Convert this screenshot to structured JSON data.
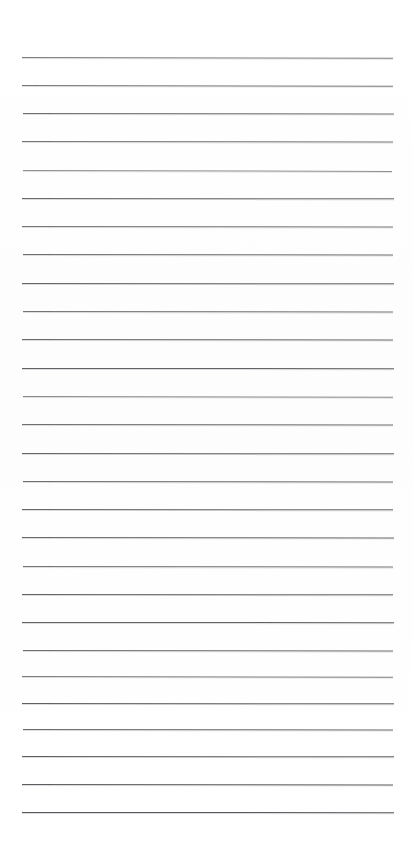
{
  "document": {
    "kind": "ruled-notebook-paper",
    "title": "Blank Ruled Notebook Page",
    "page_width": 413,
    "page_height": 855,
    "background_color": "#ffffff",
    "paper_tone": "#fdfdfd",
    "written_content": "",
    "handwriting_present": false,
    "margin_rule_present": false,
    "page_number_text": "",
    "header_text": "",
    "footer_text": ""
  },
  "ruling": {
    "line_count": 28,
    "line_color": "#4f5155",
    "line_color_light": "#8d9095",
    "line_thickness_px": 1,
    "first_line_y": 57,
    "last_line_y": 812,
    "line_spacing_px": 27.6,
    "left_margin_px": 21,
    "right_margin_px": 19,
    "top_blank_px": 57,
    "bottom_blank_px": 43
  },
  "lines": [
    {
      "index": 1,
      "y": 57,
      "x1": 22,
      "x2": 393,
      "tilt_deg": 0.12,
      "opacity": 0.78,
      "color": "#595b5f",
      "thickness": 1
    },
    {
      "index": 2,
      "y": 85,
      "x1": 22,
      "x2": 393,
      "tilt_deg": 0.1,
      "opacity": 0.8,
      "color": "#54565a",
      "thickness": 1
    },
    {
      "index": 3,
      "y": 113,
      "x1": 23,
      "x2": 394,
      "tilt_deg": 0.06,
      "opacity": 0.82,
      "color": "#4f5155",
      "thickness": 1
    },
    {
      "index": 4,
      "y": 141,
      "x1": 22,
      "x2": 393,
      "tilt_deg": 0.09,
      "opacity": 0.8,
      "color": "#53555a",
      "thickness": 1
    },
    {
      "index": 5,
      "y": 170,
      "x1": 23,
      "x2": 392,
      "tilt_deg": 0.14,
      "opacity": 0.72,
      "color": "#63656a",
      "thickness": 1
    },
    {
      "index": 6,
      "y": 198,
      "x1": 22,
      "x2": 394,
      "tilt_deg": 0.05,
      "opacity": 0.84,
      "color": "#4c4e52",
      "thickness": 1
    },
    {
      "index": 7,
      "y": 226,
      "x1": 22,
      "x2": 393,
      "tilt_deg": 0.08,
      "opacity": 0.8,
      "color": "#525458",
      "thickness": 1
    },
    {
      "index": 8,
      "y": 254,
      "x1": 23,
      "x2": 393,
      "tilt_deg": 0.07,
      "opacity": 0.82,
      "color": "#4f5155",
      "thickness": 1
    },
    {
      "index": 9,
      "y": 283,
      "x1": 22,
      "x2": 394,
      "tilt_deg": 0.04,
      "opacity": 0.85,
      "color": "#4a4c50",
      "thickness": 1
    },
    {
      "index": 10,
      "y": 311,
      "x1": 23,
      "x2": 393,
      "tilt_deg": 0.09,
      "opacity": 0.8,
      "color": "#515358",
      "thickness": 1
    },
    {
      "index": 11,
      "y": 339,
      "x1": 22,
      "x2": 393,
      "tilt_deg": 0.06,
      "opacity": 0.83,
      "color": "#4d4f53",
      "thickness": 1
    },
    {
      "index": 12,
      "y": 368,
      "x1": 22,
      "x2": 394,
      "tilt_deg": 0.03,
      "opacity": 0.86,
      "color": "#47494d",
      "thickness": 1
    },
    {
      "index": 13,
      "y": 396,
      "x1": 23,
      "x2": 393,
      "tilt_deg": 0.11,
      "opacity": 0.74,
      "color": "#5e6064",
      "thickness": 1
    },
    {
      "index": 14,
      "y": 424,
      "x1": 22,
      "x2": 393,
      "tilt_deg": 0.07,
      "opacity": 0.82,
      "color": "#4e5054",
      "thickness": 1
    },
    {
      "index": 15,
      "y": 453,
      "x1": 22,
      "x2": 394,
      "tilt_deg": 0.04,
      "opacity": 0.85,
      "color": "#4a4c50",
      "thickness": 1
    },
    {
      "index": 16,
      "y": 481,
      "x1": 23,
      "x2": 393,
      "tilt_deg": 0.08,
      "opacity": 0.82,
      "color": "#4f5155",
      "thickness": 1
    },
    {
      "index": 17,
      "y": 509,
      "x1": 22,
      "x2": 393,
      "tilt_deg": 0.05,
      "opacity": 0.84,
      "color": "#4b4d51",
      "thickness": 1
    },
    {
      "index": 18,
      "y": 537,
      "x1": 22,
      "x2": 394,
      "tilt_deg": 0.06,
      "opacity": 0.84,
      "color": "#4c4e52",
      "thickness": 1
    },
    {
      "index": 19,
      "y": 566,
      "x1": 23,
      "x2": 393,
      "tilt_deg": 0.09,
      "opacity": 0.8,
      "color": "#525459",
      "thickness": 1
    },
    {
      "index": 20,
      "y": 594,
      "x1": 22,
      "x2": 393,
      "tilt_deg": 0.05,
      "opacity": 0.85,
      "color": "#494b4f",
      "thickness": 1
    },
    {
      "index": 21,
      "y": 622,
      "x1": 22,
      "x2": 394,
      "tilt_deg": 0.03,
      "opacity": 0.86,
      "color": "#47494d",
      "thickness": 1
    },
    {
      "index": 22,
      "y": 650,
      "x1": 23,
      "x2": 393,
      "tilt_deg": 0.08,
      "opacity": 0.82,
      "color": "#4e5054",
      "thickness": 1
    },
    {
      "index": 23,
      "y": 676,
      "x1": 22,
      "x2": 393,
      "tilt_deg": 0.1,
      "opacity": 0.78,
      "color": "#56585c",
      "thickness": 1
    },
    {
      "index": 24,
      "y": 703,
      "x1": 22,
      "x2": 394,
      "tilt_deg": 0.04,
      "opacity": 0.86,
      "color": "#46484c",
      "thickness": 1
    },
    {
      "index": 25,
      "y": 729,
      "x1": 23,
      "x2": 393,
      "tilt_deg": 0.07,
      "opacity": 0.83,
      "color": "#4c4e52",
      "thickness": 1
    },
    {
      "index": 26,
      "y": 756,
      "x1": 22,
      "x2": 394,
      "tilt_deg": 0.05,
      "opacity": 0.86,
      "color": "#45474b",
      "thickness": 1
    },
    {
      "index": 27,
      "y": 784,
      "x1": 22,
      "x2": 393,
      "tilt_deg": 0.06,
      "opacity": 0.87,
      "color": "#44464a",
      "thickness": 1
    },
    {
      "index": 28,
      "y": 812,
      "x1": 22,
      "x2": 394,
      "tilt_deg": 0.03,
      "opacity": 0.88,
      "color": "#414349",
      "thickness": 1
    }
  ]
}
